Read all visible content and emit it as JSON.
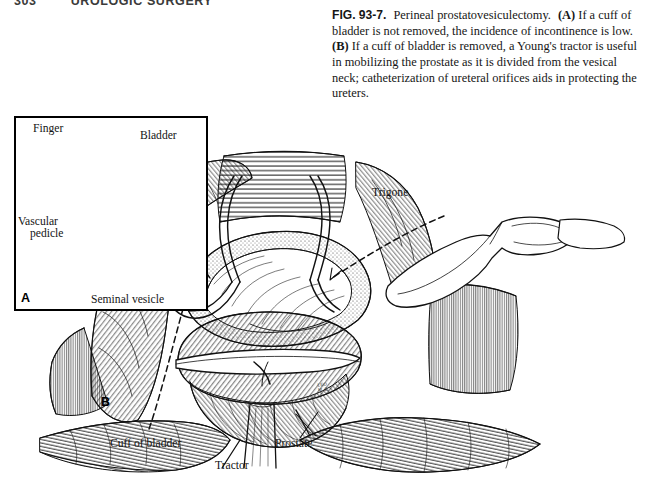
{
  "page": {
    "running_head": {
      "folio": "303",
      "title": "UROLOGIC SURGERY"
    }
  },
  "caption": {
    "figure_number": "FIG. 93-7.",
    "title": "Perineal prostatovesiculectomy.",
    "part_a_marker": "(A)",
    "part_a_text": "If a cuff of bladder is not removed, the incidence of incontinence is low.",
    "part_b_marker": "(B)",
    "part_b_text": "If a cuff of bladder is removed, a Young's tractor is useful in mobilizing the prostate as it is divided from the vesical neck; catheterization of ureteral orifices aids in protecting the ureters."
  },
  "figure": {
    "inset_panel": {
      "letter": "A",
      "labels": {
        "finger": "Finger",
        "bladder": "Bladder",
        "vascular_pedicle_line1": "Vascular",
        "vascular_pedicle_line2": "pedicle",
        "seminal_vesicle": "Seminal vesicle"
      }
    },
    "main_panel": {
      "letter": "B",
      "labels": {
        "trigone": "Trigone",
        "cuff_of_bladder": "Cuff of bladder",
        "tractor": "Tractor",
        "prostate": "Prostate"
      },
      "artist_signature": "LEO\nM. E."
    }
  },
  "colors": {
    "ink": "#111111",
    "paper": "#ffffff",
    "rule": "#000000"
  }
}
